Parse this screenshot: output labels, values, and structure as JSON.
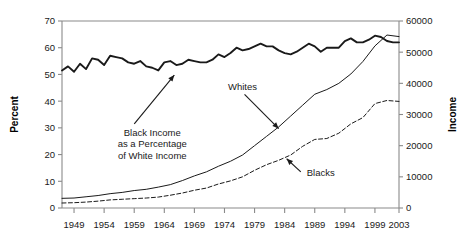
{
  "chart_data": {
    "type": "line",
    "title": "",
    "xlabel": "",
    "ylabel": "Percent",
    "y2label": "Income",
    "grid": false,
    "legend_position": "inline-annotations",
    "xlim": [
      1947,
      2003
    ],
    "ylim": [
      0,
      70
    ],
    "y2lim": [
      0,
      60000
    ],
    "xticks": [
      1949,
      1954,
      1959,
      1964,
      1969,
      1974,
      1979,
      1984,
      1989,
      1994,
      1999,
      2003
    ],
    "xtick_labels": [
      "1949",
      "1954",
      "1959",
      "1964",
      "1969",
      "1974",
      "1979",
      "1984",
      "1989",
      "1994",
      "1999",
      "2003"
    ],
    "yticks": [
      0,
      10,
      20,
      30,
      40,
      50,
      60,
      70
    ],
    "ytick_labels": [
      "0",
      "10",
      "20",
      "30",
      "40",
      "50",
      "60",
      "70"
    ],
    "y2ticks": [
      0,
      10000,
      20000,
      30000,
      40000,
      50000,
      60000
    ],
    "y2tick_labels": [
      "0",
      "10000",
      "20000",
      "30000",
      "40000",
      "50000",
      "60000"
    ],
    "annotations": [
      {
        "name": "ratio-annotation",
        "lines": [
          "Black Income",
          "as a Percentage",
          "of White Income"
        ],
        "x": 1962,
        "y": 27
      },
      {
        "name": "whites-annotation",
        "lines": [
          "Whites"
        ],
        "x": 1977,
        "y": 44
      },
      {
        "name": "blacks-annotation",
        "lines": [
          "Blacks"
        ],
        "x": 1990,
        "y": 12
      }
    ],
    "series": [
      {
        "name": "Black Income as a Percentage of White Income",
        "axis": "left",
        "style": "solid-thick",
        "unit": "percent",
        "x": [
          1947,
          1948,
          1949,
          1950,
          1951,
          1952,
          1953,
          1954,
          1955,
          1956,
          1957,
          1958,
          1959,
          1960,
          1961,
          1962,
          1963,
          1964,
          1965,
          1966,
          1967,
          1968,
          1969,
          1970,
          1971,
          1972,
          1973,
          1974,
          1975,
          1976,
          1977,
          1978,
          1979,
          1980,
          1981,
          1982,
          1983,
          1984,
          1985,
          1986,
          1987,
          1988,
          1989,
          1990,
          1991,
          1992,
          1993,
          1994,
          1995,
          1996,
          1997,
          1998,
          1999,
          2000,
          2001,
          2002,
          2003
        ],
        "y": [
          51.5,
          53.0,
          51.0,
          54.0,
          52.0,
          56.0,
          55.5,
          53.5,
          57.0,
          56.5,
          56.0,
          54.5,
          54.0,
          55.0,
          53.0,
          52.5,
          51.5,
          54.5,
          55.0,
          53.5,
          54.0,
          55.5,
          55.0,
          54.5,
          54.5,
          55.5,
          57.5,
          56.5,
          58.0,
          60.0,
          59.0,
          59.5,
          60.5,
          61.5,
          60.5,
          60.5,
          59.0,
          58.0,
          57.5,
          58.5,
          60.0,
          61.5,
          60.5,
          58.5,
          60.0,
          60.0,
          60.0,
          62.5,
          63.5,
          62.0,
          62.0,
          63.0,
          64.5,
          64.0,
          62.5,
          62.0,
          62.0
        ]
      },
      {
        "name": "Whites",
        "axis": "right",
        "style": "solid-thin",
        "unit": "income",
        "x": [
          1947,
          1949,
          1951,
          1953,
          1955,
          1957,
          1959,
          1961,
          1963,
          1965,
          1967,
          1969,
          1971,
          1973,
          1975,
          1977,
          1979,
          1981,
          1983,
          1985,
          1987,
          1989,
          1991,
          1993,
          1995,
          1997,
          1999,
          2001,
          2003
        ],
        "y": [
          3100,
          3200,
          3600,
          4000,
          4600,
          5000,
          5600,
          6000,
          6700,
          7500,
          8800,
          10300,
          11600,
          13400,
          15000,
          17000,
          20000,
          23000,
          26000,
          29500,
          33000,
          36500,
          38000,
          40000,
          43000,
          47000,
          52000,
          55500,
          55000
        ]
      },
      {
        "name": "Blacks",
        "axis": "right",
        "style": "dashed",
        "unit": "income",
        "x": [
          1947,
          1949,
          1951,
          1953,
          1955,
          1957,
          1959,
          1961,
          1963,
          1965,
          1967,
          1969,
          1971,
          1973,
          1975,
          1977,
          1979,
          1981,
          1983,
          1985,
          1987,
          1989,
          1991,
          1993,
          1995,
          1997,
          1999,
          2001,
          2003
        ],
        "y": [
          1600,
          1700,
          1900,
          2200,
          2600,
          2800,
          3000,
          3200,
          3500,
          4100,
          4800,
          5700,
          6400,
          7700,
          8700,
          10000,
          12100,
          13900,
          15300,
          17000,
          19800,
          22000,
          22300,
          24000,
          27000,
          29000,
          33500,
          34500,
          34200
        ]
      }
    ]
  }
}
